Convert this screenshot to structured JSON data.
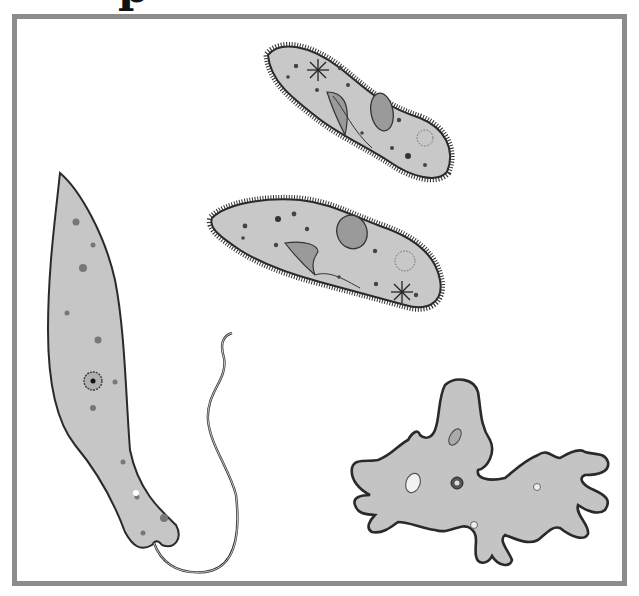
{
  "header": {
    "title_fragment": "p"
  },
  "frame": {
    "border_color": "#8c8c8c",
    "background": "#ffffff"
  },
  "illustration": {
    "subject": "protists",
    "organisms": [
      {
        "name": "paramecium",
        "position": "top-center"
      },
      {
        "name": "paramecium",
        "position": "center"
      },
      {
        "name": "euglena",
        "position": "left"
      },
      {
        "name": "amoeba",
        "position": "bottom-right"
      }
    ],
    "colors": {
      "cell_fill": "#c6c6c6",
      "outline": "#2a2a2a",
      "organelle": "#6e6e6e"
    }
  }
}
